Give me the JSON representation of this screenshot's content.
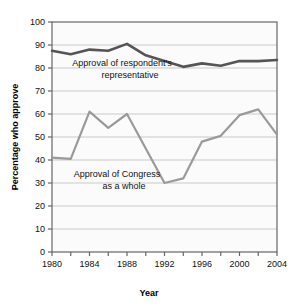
{
  "chart_data": {
    "type": "line",
    "title": "",
    "xlabel": "Year",
    "ylabel": "Percentage who approve",
    "xlim": [
      1980,
      2004
    ],
    "ylim": [
      0,
      100
    ],
    "grid": true,
    "legend_position": "inline-annotations",
    "x": [
      1980,
      1982,
      1984,
      1986,
      1988,
      1990,
      1992,
      1994,
      1996,
      1998,
      2000,
      2002,
      2004
    ],
    "xticks": [
      1980,
      1982,
      1984,
      1986,
      1988,
      1990,
      1992,
      1994,
      1996,
      1998,
      2000,
      2002,
      2004
    ],
    "xtick_labels": [
      "1980",
      "",
      "1984",
      "",
      "1988",
      "",
      "1992",
      "",
      "1996",
      "",
      "2000",
      "",
      "2004"
    ],
    "yticks": [
      0,
      10,
      20,
      30,
      40,
      50,
      60,
      70,
      80,
      90,
      100
    ],
    "ytick_labels": [
      "0",
      "10",
      "20",
      "30",
      "40",
      "50",
      "60",
      "70",
      "80",
      "90",
      "100"
    ],
    "series": [
      {
        "name": "Approval of respondent's representative",
        "color": "#555555",
        "width": 2.6,
        "values": [
          87.5,
          86.0,
          88.0,
          87.5,
          90.5,
          85.5,
          83.0,
          80.5,
          82.0,
          81.0,
          83.0,
          83.0,
          83.5
        ]
      },
      {
        "name": "Approval of Congress as a whole",
        "color": "#9a9a9a",
        "width": 2.2,
        "values": [
          41.0,
          40.5,
          61.0,
          54.0,
          60.0,
          45.0,
          30.0,
          32.0,
          48.0,
          50.5,
          59.5,
          62.0,
          51.0
        ]
      }
    ],
    "annotations": [
      {
        "id": "annotation-representative",
        "lines": [
          "Approval of respondent's",
          "representative"
        ]
      },
      {
        "id": "annotation-congress",
        "lines": [
          "Approval of Congress",
          "as a whole"
        ]
      }
    ]
  },
  "colors": {
    "background": "#ffffff",
    "plot_background": "#fbfbfb",
    "gridline": "#c9c9c9",
    "axis": "#666666",
    "text": "#111111",
    "series_representative": "#555555",
    "series_congress": "#9a9a9a"
  }
}
